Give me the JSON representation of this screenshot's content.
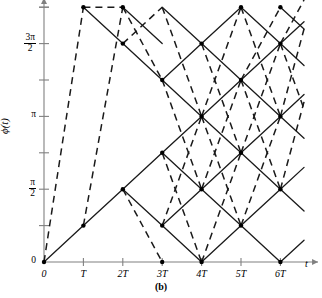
{
  "figure": {
    "caption": "(b)",
    "ylabel_phi": "ϕ(",
    "ylabel_t": "t",
    "ylabel_close": ")",
    "xlabel": "t"
  },
  "chart_data": {
    "type": "line",
    "title": "",
    "subtitle": "",
    "xlabel": "t",
    "ylabel": "ϕ(t)",
    "caption": "(b)",
    "grid": false,
    "legend": null,
    "x": {
      "ticks": [
        0,
        1,
        2,
        3,
        4,
        5,
        6
      ],
      "tick_labels": [
        "0",
        "T",
        "2T",
        "3T",
        "4T",
        "5T",
        "6T"
      ],
      "xlim": [
        0,
        6.6
      ],
      "axis_arrow": true,
      "pixel_origin_x": 44,
      "pixel_per_unit": 39.4
    },
    "y": {
      "ticks": [
        0,
        1,
        2,
        3,
        4,
        5,
        6,
        7
      ],
      "tick_labels": [
        "0",
        "",
        "π/2",
        "",
        "π",
        "",
        "3π/2",
        ""
      ],
      "labeled_ticks": [
        {
          "value": 0,
          "label": "0",
          "type": "plain"
        },
        {
          "value": 2,
          "label": "π/2",
          "type": "frac",
          "num": "π",
          "den": "2"
        },
        {
          "value": 4,
          "label": "π",
          "type": "plain"
        },
        {
          "value": 6,
          "label": "3π/2",
          "type": "frac",
          "num": "3π",
          "den": "2"
        }
      ],
      "ylim": [
        0,
        7.2
      ],
      "unit_step": "π/4",
      "axis_arrow": true,
      "pixel_zero_y": 262,
      "pixel_per_unit": 36.4
    },
    "styles": {
      "solid_color": "#1a1a1a",
      "dashed_color": "#1a1a1a",
      "axis_color": "#808080",
      "node_color": "#000000",
      "solid_width": 1.3,
      "dashed_width": 1.5,
      "dash_pattern": "7,5"
    },
    "nodes": [
      {
        "x": 0,
        "y": 0
      },
      {
        "x": 1,
        "y": 1
      },
      {
        "x": 1,
        "y": 7
      },
      {
        "x": 2,
        "y": 2
      },
      {
        "x": 2,
        "y": 6
      },
      {
        "x": 2,
        "y": 7
      },
      {
        "x": 3,
        "y": 1
      },
      {
        "x": 3,
        "y": 3
      },
      {
        "x": 3,
        "y": 5
      },
      {
        "x": 3,
        "y": 0
      },
      {
        "x": 4,
        "y": 0
      },
      {
        "x": 4,
        "y": 2
      },
      {
        "x": 4,
        "y": 4
      },
      {
        "x": 4,
        "y": 6
      },
      {
        "x": 5,
        "y": 1
      },
      {
        "x": 5,
        "y": 3
      },
      {
        "x": 5,
        "y": 5
      },
      {
        "x": 5,
        "y": 7
      },
      {
        "x": 6,
        "y": 0
      },
      {
        "x": 6,
        "y": 2
      },
      {
        "x": 6,
        "y": 4
      },
      {
        "x": 6,
        "y": 6
      },
      {
        "x": 6,
        "y": 7
      }
    ],
    "solid_branches": [
      [
        [
          0,
          0
        ],
        [
          1,
          1
        ]
      ],
      [
        [
          1,
          1
        ],
        [
          2,
          2
        ]
      ],
      [
        [
          1,
          7
        ],
        [
          2,
          6
        ]
      ],
      [
        [
          2,
          2
        ],
        [
          3,
          3
        ]
      ],
      [
        [
          2,
          2
        ],
        [
          3,
          1
        ]
      ],
      [
        [
          2,
          6
        ],
        [
          3,
          5
        ]
      ],
      [
        [
          2,
          7
        ],
        [
          3,
          6
        ]
      ],
      [
        [
          3,
          1
        ],
        [
          4,
          0
        ]
      ],
      [
        [
          3,
          1
        ],
        [
          4,
          2
        ]
      ],
      [
        [
          3,
          3
        ],
        [
          4,
          2
        ]
      ],
      [
        [
          3,
          3
        ],
        [
          4,
          4
        ]
      ],
      [
        [
          3,
          5
        ],
        [
          4,
          4
        ]
      ],
      [
        [
          3,
          5
        ],
        [
          4,
          6
        ]
      ],
      [
        [
          3,
          7
        ],
        [
          4,
          6
        ]
      ],
      [
        [
          4,
          0
        ],
        [
          5,
          1
        ]
      ],
      [
        [
          4,
          2
        ],
        [
          5,
          1
        ]
      ],
      [
        [
          4,
          2
        ],
        [
          5,
          3
        ]
      ],
      [
        [
          4,
          4
        ],
        [
          5,
          3
        ]
      ],
      [
        [
          4,
          4
        ],
        [
          5,
          5
        ]
      ],
      [
        [
          4,
          6
        ],
        [
          5,
          5
        ]
      ],
      [
        [
          4,
          6
        ],
        [
          5,
          7
        ]
      ],
      [
        [
          5,
          1
        ],
        [
          6,
          0
        ]
      ],
      [
        [
          5,
          1
        ],
        [
          6,
          2
        ]
      ],
      [
        [
          5,
          3
        ],
        [
          6,
          2
        ]
      ],
      [
        [
          5,
          3
        ],
        [
          6,
          4
        ]
      ],
      [
        [
          5,
          5
        ],
        [
          6,
          4
        ]
      ],
      [
        [
          5,
          5
        ],
        [
          6,
          6
        ]
      ],
      [
        [
          5,
          7
        ],
        [
          6,
          6
        ]
      ],
      [
        [
          6,
          0
        ],
        [
          6.6,
          0.6
        ]
      ],
      [
        [
          6,
          2
        ],
        [
          6.6,
          2.6
        ]
      ],
      [
        [
          6,
          2
        ],
        [
          6.6,
          1.4
        ]
      ],
      [
        [
          6,
          4
        ],
        [
          6.6,
          4.6
        ]
      ],
      [
        [
          6,
          4
        ],
        [
          6.6,
          3.4
        ]
      ],
      [
        [
          6,
          6
        ],
        [
          6.6,
          6.6
        ]
      ],
      [
        [
          6,
          6
        ],
        [
          6.6,
          5.4
        ]
      ],
      [
        [
          6,
          7
        ],
        [
          6.6,
          6.4
        ]
      ]
    ],
    "dashed_branches": [
      [
        [
          0,
          0
        ],
        [
          1,
          7
        ]
      ],
      [
        [
          1,
          1
        ],
        [
          2,
          7
        ]
      ],
      [
        [
          1,
          7
        ],
        [
          2,
          7
        ]
      ],
      [
        [
          2,
          2
        ],
        [
          3,
          0
        ]
      ],
      [
        [
          2,
          6
        ],
        [
          3,
          7
        ]
      ],
      [
        [
          2,
          7
        ],
        [
          3,
          5
        ]
      ],
      [
        [
          3,
          1
        ],
        [
          4,
          4
        ]
      ],
      [
        [
          3,
          3
        ],
        [
          4,
          0
        ]
      ],
      [
        [
          3,
          5
        ],
        [
          4,
          2
        ]
      ],
      [
        [
          3,
          7
        ],
        [
          4,
          4
        ]
      ],
      [
        [
          4,
          0
        ],
        [
          5,
          3
        ]
      ],
      [
        [
          4,
          2
        ],
        [
          5,
          5
        ]
      ],
      [
        [
          4,
          4
        ],
        [
          5,
          7
        ]
      ],
      [
        [
          4,
          4
        ],
        [
          5,
          1
        ]
      ],
      [
        [
          4,
          6
        ],
        [
          5,
          3
        ]
      ],
      [
        [
          5,
          1
        ],
        [
          6,
          4
        ]
      ],
      [
        [
          5,
          3
        ],
        [
          6,
          6
        ]
      ],
      [
        [
          5,
          5
        ],
        [
          6,
          7
        ]
      ],
      [
        [
          5,
          5
        ],
        [
          6,
          2
        ]
      ],
      [
        [
          5,
          7
        ],
        [
          6,
          4
        ]
      ],
      [
        [
          6,
          2
        ],
        [
          6.6,
          4.4
        ]
      ],
      [
        [
          6,
          4
        ],
        [
          6.6,
          6.4
        ]
      ],
      [
        [
          6,
          6
        ],
        [
          6.6,
          7.2
        ]
      ],
      [
        [
          6,
          6
        ],
        [
          6.6,
          4.2
        ]
      ]
    ]
  }
}
